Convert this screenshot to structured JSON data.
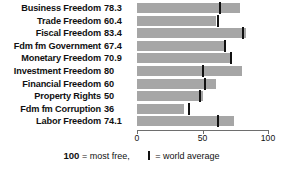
{
  "chart_data": {
    "type": "bar",
    "orientation": "horizontal",
    "title": "",
    "xlabel": "",
    "ylabel": "",
    "xlim": [
      0,
      100
    ],
    "grid": false,
    "categories": [
      "Business Freedom",
      "Trade Freedom",
      "Fiscal Freedom",
      "Fdm fm Government",
      "Monetary Freedom",
      "Investment Freedom",
      "Financial Freedom",
      "Property Rights",
      "Fdm fm Corruption",
      "Labor Freedom"
    ],
    "values": [
      78.3,
      60.4,
      83.4,
      67.4,
      70.9,
      80,
      60,
      50,
      36,
      74.1
    ],
    "value_labels": [
      "78.3",
      "60.4",
      "83.4",
      "67.4",
      "70.9",
      "80",
      "60",
      "50",
      "36",
      "74.1"
    ],
    "world_average_markers": [
      63,
      62,
      81,
      67,
      72,
      50,
      52,
      48,
      40,
      62
    ],
    "xticks": [
      0,
      50,
      100
    ],
    "xtick_labels": [
      "0",
      "50",
      "100"
    ],
    "bar_color": "#a6a6a6",
    "marker_color": "#111111",
    "axis_color": "#6e6e6e"
  },
  "legend": {
    "most_free_value": "100",
    "most_free_text": "= most free,",
    "world_average_text": "= world average"
  }
}
